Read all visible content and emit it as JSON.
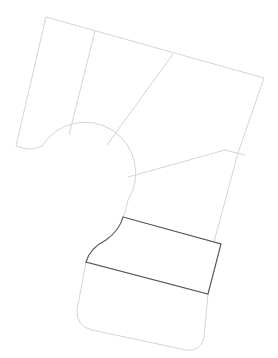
{
  "header": {
    "cut_title": ""
  },
  "diagram": {
    "colors": {
      "outline": "#d4d4d4",
      "highlight": "#555555",
      "background": "#ffffff"
    },
    "regions": [
      {
        "id": "region-1",
        "highlighted": false
      },
      {
        "id": "region-2",
        "highlighted": false
      },
      {
        "id": "region-3",
        "highlighted": false
      },
      {
        "id": "region-4",
        "highlighted": false
      },
      {
        "id": "region-5",
        "highlighted": true
      },
      {
        "id": "region-6",
        "highlighted": false
      }
    ]
  }
}
